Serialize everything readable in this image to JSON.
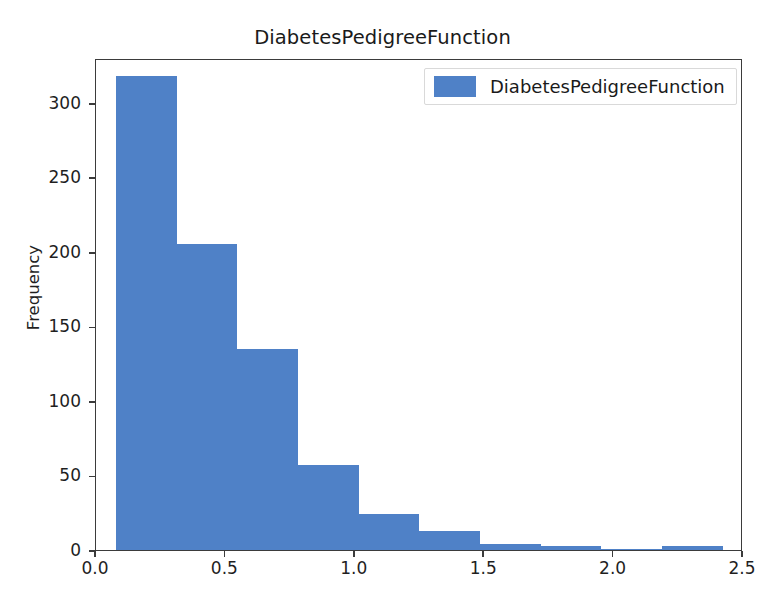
{
  "chart_data": {
    "type": "bar",
    "subtype": "histogram",
    "title": "DiabetesPedigreeFunction",
    "xlabel": "",
    "ylabel": "Frequency",
    "xlim": [
      0.0,
      2.5
    ],
    "ylim": [
      0,
      330
    ],
    "grid": false,
    "legend_position": "upper right",
    "bar_color": "#4F81C7",
    "bin_edges": [
      0.078,
      0.3123,
      0.5466,
      0.7809,
      1.0152,
      1.2495,
      1.4838,
      1.7181,
      1.9524,
      2.1867,
      2.421
    ],
    "categories": [
      "0.08–0.31",
      "0.31–0.55",
      "0.55–0.78",
      "0.78–1.02",
      "1.02–1.25",
      "1.25–1.48",
      "1.48–1.72",
      "1.72–1.95",
      "1.95–2.19",
      "2.19–2.42"
    ],
    "values": [
      318,
      205,
      135,
      57,
      24,
      13,
      4,
      3,
      1,
      3
    ],
    "series": [
      {
        "name": "DiabetesPedigreeFunction",
        "values": [
          318,
          205,
          135,
          57,
          24,
          13,
          4,
          3,
          1,
          3
        ]
      }
    ],
    "xticks": [
      {
        "value": 0.0,
        "label": "0.0"
      },
      {
        "value": 0.5,
        "label": "0.5"
      },
      {
        "value": 1.0,
        "label": "1.0"
      },
      {
        "value": 1.5,
        "label": "1.5"
      },
      {
        "value": 2.0,
        "label": "2.0"
      },
      {
        "value": 2.5,
        "label": "2.5"
      }
    ],
    "yticks": [
      {
        "value": 0,
        "label": "0"
      },
      {
        "value": 50,
        "label": "50"
      },
      {
        "value": 100,
        "label": "100"
      },
      {
        "value": 150,
        "label": "150"
      },
      {
        "value": 200,
        "label": "200"
      },
      {
        "value": 250,
        "label": "250"
      },
      {
        "value": 300,
        "label": "300"
      }
    ],
    "legend": [
      {
        "label": "DiabetesPedigreeFunction",
        "color": "#4F81C7"
      }
    ]
  }
}
